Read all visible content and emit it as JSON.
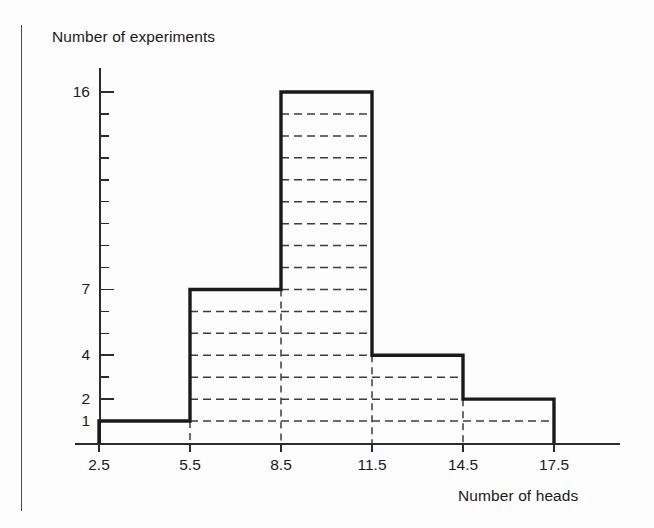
{
  "chart_data": {
    "type": "bar",
    "title": "",
    "xlabel": "Number of heads",
    "ylabel": "Number of experiments",
    "categories": [
      "2.5-5.5",
      "5.5-8.5",
      "8.5-11.5",
      "11.5-14.5",
      "14.5-17.5"
    ],
    "bin_edges": [
      2.5,
      5.5,
      8.5,
      11.5,
      14.5,
      17.5
    ],
    "values": [
      1,
      7,
      16,
      4,
      2
    ],
    "xtick_labels": [
      "2.5",
      "5.5",
      "8.5",
      "11.5",
      "14.5",
      "17.5"
    ],
    "ytick_labels": [
      "16",
      "7",
      "4",
      "2",
      "1"
    ],
    "ytick_values": [
      16,
      7,
      4,
      2,
      1
    ],
    "xlim": [
      2.5,
      17.5
    ],
    "ylim": [
      0,
      16
    ],
    "grid": "horizontal-dashed-inside-bars",
    "legend": "none",
    "style": "histogram-step-outline"
  },
  "figure": {
    "y_axis_title": "Number of experiments",
    "x_axis_title": "Number of heads",
    "colors": {
      "outline": "#1a1a1a",
      "gridline": "#3c3c3c",
      "axis": "#2b2b2b",
      "background": "#fdfdfd"
    }
  }
}
